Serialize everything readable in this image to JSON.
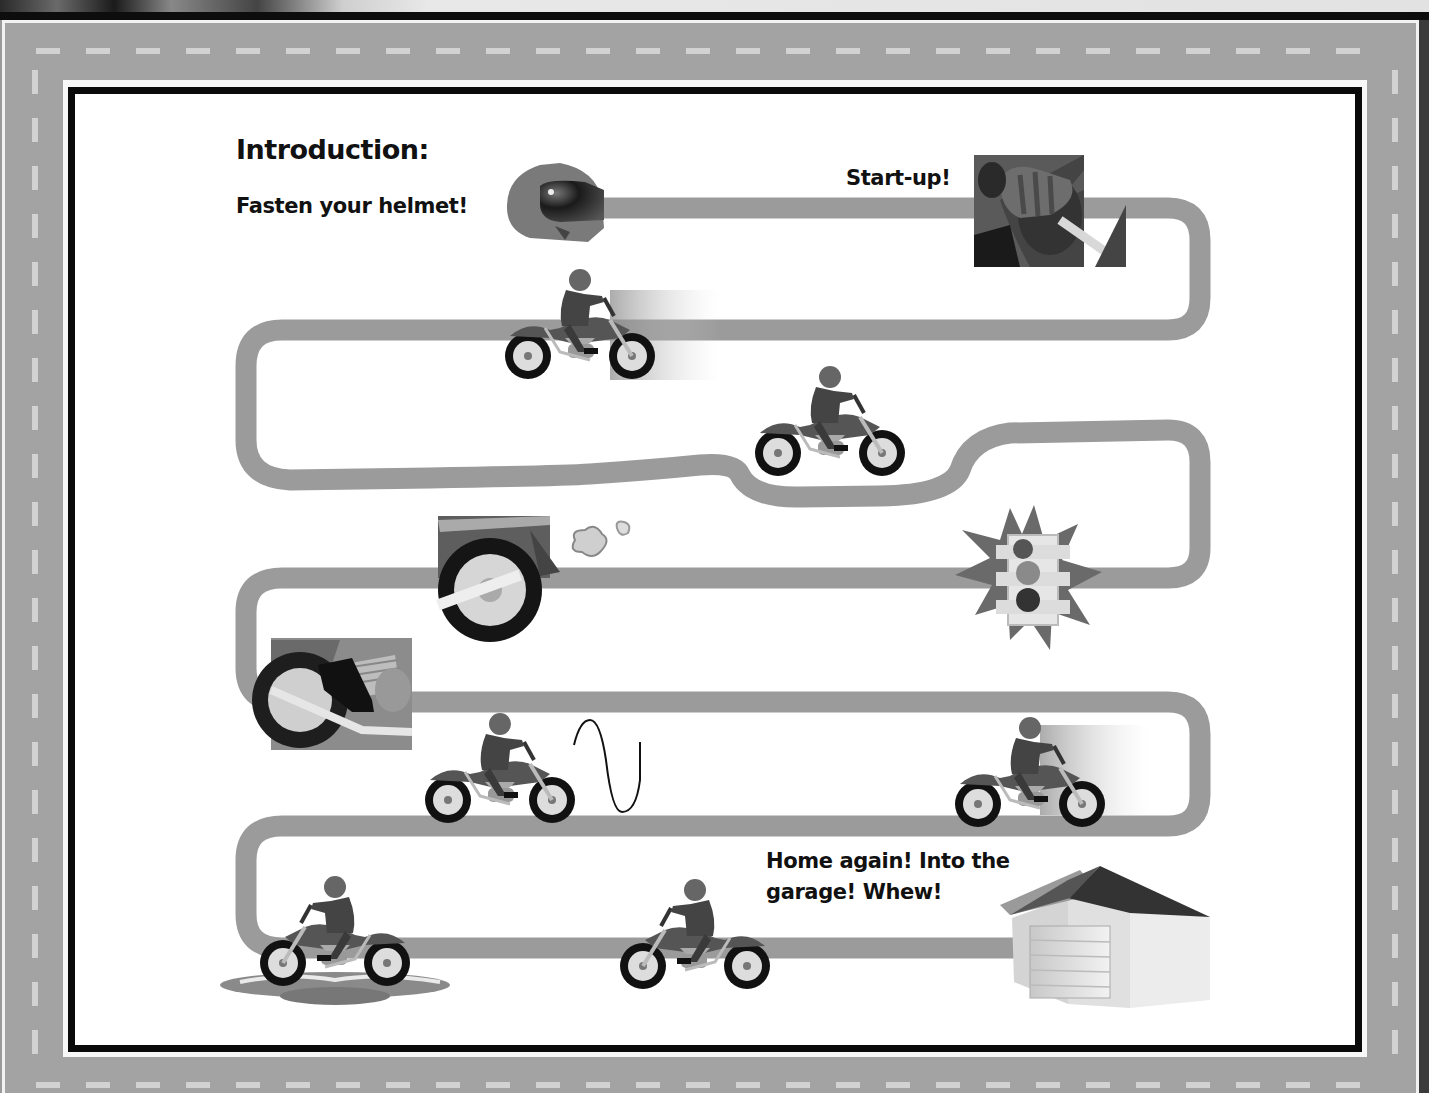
{
  "diagram": {
    "title": "Introduction:",
    "type": "road-journey",
    "theme_colors": {
      "road": "#9b9b9b",
      "frame_border": "#0a0a0a",
      "panel_background": "#ffffff",
      "outer_road": "#a3a3a3",
      "lane_dash": "#d2d2d2"
    },
    "stages": [
      {
        "id": "helmet",
        "label": "Fasten your helmet!",
        "icon": "helmet-icon"
      },
      {
        "id": "start",
        "label": "Start-up!",
        "icon": "ignition-hand-icon"
      },
      {
        "id": "ride-1",
        "label": "",
        "icon": "motorcycle-speeding-icon"
      },
      {
        "id": "ride-2",
        "label": "",
        "icon": "motorcycle-curve-icon"
      },
      {
        "id": "exhaust",
        "label": "",
        "icon": "rear-wheel-exhaust-icon"
      },
      {
        "id": "traffic-light",
        "label": "",
        "icon": "traffic-light-burst-icon"
      },
      {
        "id": "footpeg",
        "label": "",
        "icon": "foot-on-peg-icon"
      },
      {
        "id": "wheelie",
        "label": "",
        "icon": "motorcycle-wave-icon"
      },
      {
        "id": "ride-3",
        "label": "",
        "icon": "motorcycle-speeding-icon"
      },
      {
        "id": "puddle",
        "label": "",
        "icon": "motorcycle-puddle-icon"
      },
      {
        "id": "ride-4",
        "label": "",
        "icon": "motorcycle-icon"
      },
      {
        "id": "garage",
        "label": "Home again!  Into the garage!  Whew!",
        "icon": "garage-icon"
      }
    ]
  }
}
